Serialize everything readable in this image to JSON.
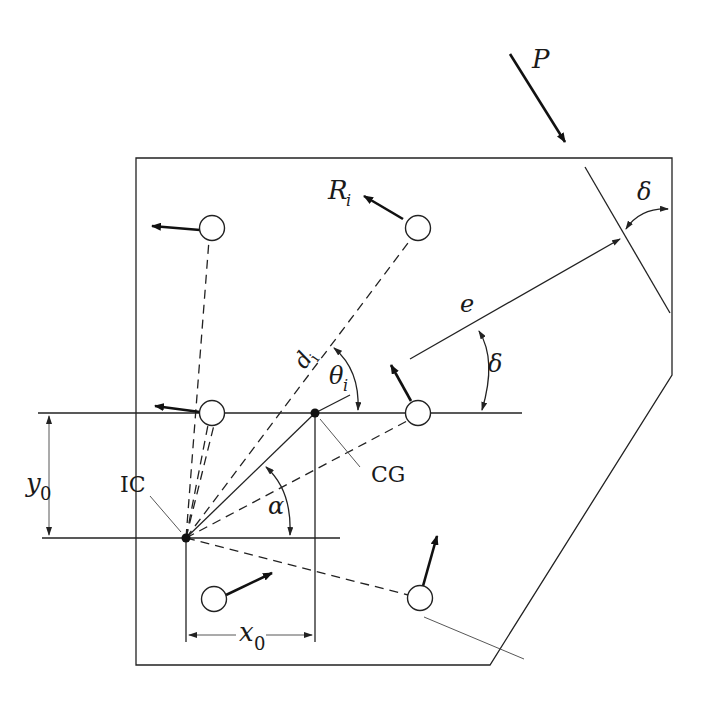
{
  "diagram": {
    "type": "eccentrically loaded bolt group - instantaneous center method",
    "labels": {
      "load": "P",
      "bolt_force": "R",
      "bolt_force_sub": "i",
      "distance": "d",
      "distance_sub": "i",
      "angle_theta": "θ",
      "angle_theta_sub": "i",
      "eccentricity": "e",
      "delta_top": "δ",
      "delta_mid": "δ",
      "alpha": "α",
      "ic": "IC",
      "cg": "CG",
      "y0": "y",
      "y0_sub": "0",
      "x0": "x",
      "x0_sub": "0"
    },
    "colors": {
      "line": "#222222",
      "background": "#ffffff"
    },
    "points": {
      "ic": [
        186,
        538
      ],
      "cg": [
        315,
        413
      ]
    },
    "bolts": [
      {
        "id": "b1",
        "x": 212,
        "y": 228
      },
      {
        "id": "b2",
        "x": 418,
        "y": 228
      },
      {
        "id": "b3",
        "x": 212,
        "y": 413
      },
      {
        "id": "b4",
        "x": 418,
        "y": 413
      },
      {
        "id": "b5",
        "x": 214,
        "y": 599
      },
      {
        "id": "b6",
        "x": 420,
        "y": 598
      }
    ]
  }
}
